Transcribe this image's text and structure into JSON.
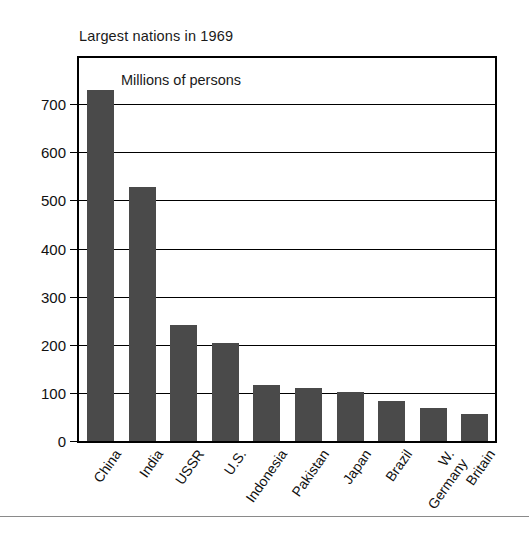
{
  "chart_data": {
    "type": "bar",
    "title": "Largest nations in 1969",
    "subtitle": "Millions of persons",
    "xlabel": "",
    "ylabel": "",
    "categories": [
      "China",
      "India",
      "USSR",
      "U.S.",
      "Indonesia",
      "Pakistan",
      "Japan",
      "Brazil",
      "W. Germany",
      "Britain"
    ],
    "values": [
      730,
      527,
      241,
      203,
      116,
      110,
      102,
      84,
      68,
      56
    ],
    "ylim": [
      0,
      796
    ],
    "yticks": [
      0,
      100,
      200,
      300,
      400,
      500,
      600,
      700
    ],
    "ytick_labels": [
      "0",
      "100",
      "200",
      "300",
      "400",
      "500",
      "600",
      "700"
    ],
    "grid": true,
    "legend": "none",
    "bar_color": "#4a4a4a",
    "axis_color": "#000000",
    "background_color": "#ffffff"
  },
  "figure": {
    "title": "Largest nations in 1969",
    "subtitle": "Millions of persons"
  }
}
